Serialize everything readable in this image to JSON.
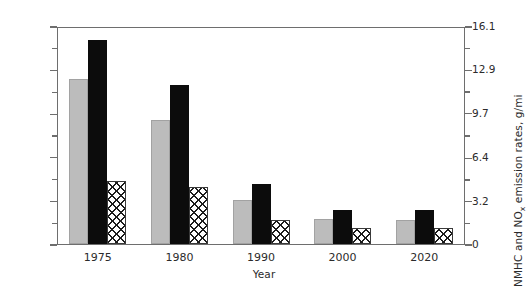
{
  "chart_data": {
    "type": "bar",
    "title": "",
    "subtitle": "",
    "xlabel": "Year",
    "ylabel": "CO emission rate, g/mi",
    "y2label": "NMHC and NOₓ emission rates, g/mi",
    "categories": [
      "1975",
      "1980",
      "1990",
      "2000",
      "2020"
    ],
    "ylim": [
      0,
      80.5
    ],
    "y2lim": [
      0,
      16.1
    ],
    "yticks": [
      "0",
      "16.1",
      "32.2",
      "48.3",
      "64.4",
      "80.5"
    ],
    "ytick_values": [
      0,
      16.1,
      32.2,
      48.3,
      64.4,
      80.5
    ],
    "y2ticks": [
      "0",
      "3.2",
      "6.4",
      "9.7",
      "12.9",
      "16.1"
    ],
    "y2tick_values": [
      0,
      3.2,
      6.4,
      9.7,
      12.9,
      16.1
    ],
    "grid": false,
    "legend_position": "none",
    "series": [
      {
        "name": "CO",
        "axis": "left",
        "style": "gray",
        "values": [
          60.9,
          45.8,
          16.1,
          9.2,
          8.9
        ]
      },
      {
        "name": "NMHC",
        "axis": "left",
        "style": "black",
        "values": [
          75.3,
          58.6,
          22.0,
          12.6,
          12.6
        ]
      },
      {
        "name": "NOx",
        "axis": "right",
        "style": "hatch",
        "values": [
          4.65,
          4.22,
          1.8,
          1.2,
          1.15
        ]
      }
    ]
  },
  "axes": {
    "left_title": "CO emission rate, g/mi",
    "right_title_main": "NMHC and NO",
    "right_title_sub": "x",
    "right_title_tail": " emission rates, g/mi",
    "x_title": "Year"
  }
}
